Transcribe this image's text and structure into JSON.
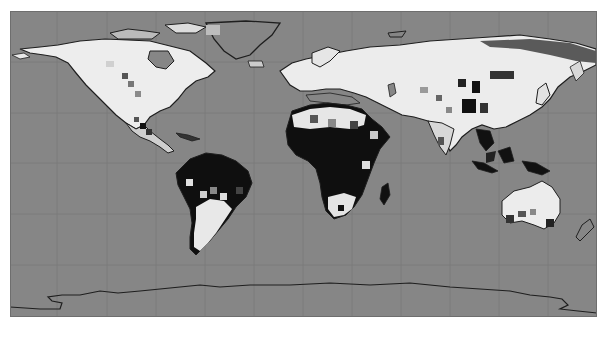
{
  "map": {
    "title": "Global grayscale gridded land map",
    "projection": "equirectangular",
    "colors": {
      "ocean": "#868686",
      "gridline": "#7a7a7a",
      "coastline": "#1e1e1e",
      "land_high": "#f2f2f2",
      "land_mid": "#c8c8c8",
      "land_low": "#505050",
      "land_min": "#0e0e0e"
    },
    "grid": {
      "x_lines_px": [
        57,
        107,
        156,
        205,
        254,
        303,
        352,
        401,
        450,
        499,
        548
      ],
      "y_lines_px": [
        51,
        102,
        152,
        203,
        254
      ]
    },
    "regions": [
      {
        "name": "North America",
        "tone": "light, with dark patches in Mexico"
      },
      {
        "name": "Greenland",
        "tone": "ocean-gray interior with coastline"
      },
      {
        "name": "South America",
        "tone": "dark north (Amazon), light south"
      },
      {
        "name": "Europe",
        "tone": "light"
      },
      {
        "name": "Africa",
        "tone": "light north (Sahara band), dark central, mixed south"
      },
      {
        "name": "Asia",
        "tone": "light with dark patches in central/east Asia, dark Southeast Asia"
      },
      {
        "name": "Australia",
        "tone": "light interior, dark south coast patches"
      },
      {
        "name": "Antarctica",
        "tone": "ocean-gray with coastline only"
      }
    ]
  }
}
